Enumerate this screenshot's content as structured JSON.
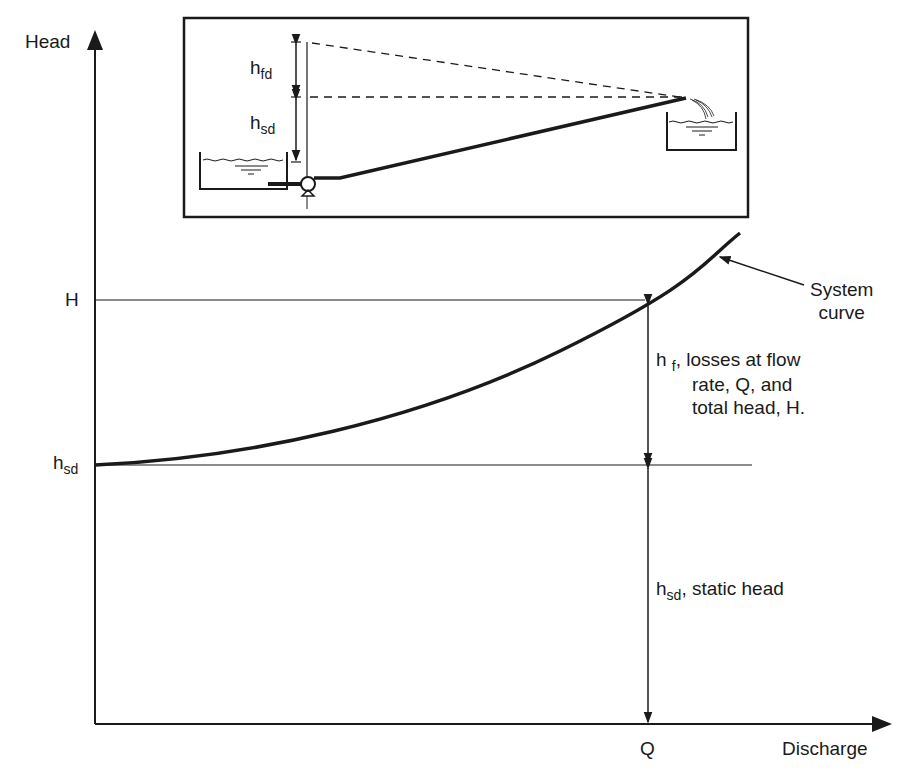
{
  "diagram": {
    "axes": {
      "y_label": "Head",
      "x_label": "Discharge",
      "y_ticks": [
        {
          "main": "H",
          "sub": ""
        },
        {
          "main": "h",
          "sub": "sd"
        }
      ],
      "x_ticks": [
        {
          "main": "Q"
        }
      ]
    },
    "curve": {
      "label_line1": "System",
      "label_line2": "curve",
      "points": [
        [
          95,
          465
        ],
        [
          160,
          461
        ],
        [
          240,
          450
        ],
        [
          320,
          433
        ],
        [
          400,
          410
        ],
        [
          480,
          388
        ],
        [
          560,
          351
        ],
        [
          647,
          301
        ],
        [
          700,
          263
        ],
        [
          740,
          233
        ]
      ]
    },
    "annotations": {
      "losses": {
        "main": "h",
        "sub": "f",
        "line1": ", losses at flow",
        "line2": "rate, Q, and",
        "line3": "total head, H."
      },
      "static": {
        "main": "h",
        "sub": "sd",
        "text": ", static head"
      }
    },
    "inset": {
      "hfd": {
        "main": "h",
        "sub": "fd"
      },
      "hsd": {
        "main": "h",
        "sub": "sd"
      }
    },
    "colors": {
      "line": "#1a1a1a",
      "background": "#ffffff"
    }
  }
}
